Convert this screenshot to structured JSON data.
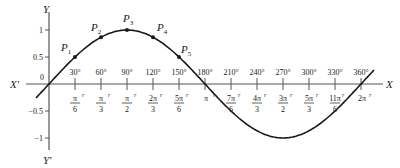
{
  "diagram": {
    "type": "sine-curve",
    "function": "y = sin x",
    "axes": {
      "x_label": "X",
      "x_neg_label": "X'",
      "y_label": "Y",
      "y_neg_label": "Y'",
      "origin_label": "0"
    },
    "y_ticks": [
      {
        "value": 1,
        "label": "1"
      },
      {
        "value": 0.5,
        "label": "0.5"
      },
      {
        "value": -0.5,
        "label": "−0.5"
      },
      {
        "value": -1,
        "label": "−1"
      }
    ],
    "x_ticks": [
      {
        "deg": 30,
        "deg_label": "30°",
        "rad_num": "π",
        "rad_den": "6"
      },
      {
        "deg": 60,
        "deg_label": "60°",
        "rad_num": "π",
        "rad_den": "3"
      },
      {
        "deg": 90,
        "deg_label": "90°",
        "rad_num": "π",
        "rad_den": "2"
      },
      {
        "deg": 120,
        "deg_label": "120°",
        "rad_num": "2π",
        "rad_den": "3"
      },
      {
        "deg": 150,
        "deg_label": "150°",
        "rad_num": "5π",
        "rad_den": "6"
      },
      {
        "deg": 180,
        "deg_label": "180°",
        "rad_num": "π",
        "rad_den": ""
      },
      {
        "deg": 210,
        "deg_label": "210°",
        "rad_num": "7π",
        "rad_den": "6"
      },
      {
        "deg": 240,
        "deg_label": "240°",
        "rad_num": "4π",
        "rad_den": "3"
      },
      {
        "deg": 270,
        "deg_label": "270°",
        "rad_num": "3π",
        "rad_den": "2"
      },
      {
        "deg": 300,
        "deg_label": "300°",
        "rad_num": "5π",
        "rad_den": "3"
      },
      {
        "deg": 330,
        "deg_label": "330°",
        "rad_num": "11π",
        "rad_den": "6"
      },
      {
        "deg": 360,
        "deg_label": "360°",
        "rad_num": "2π",
        "rad_den": ""
      }
    ],
    "radian_superscript": "r",
    "curve_domain_deg": [
      -15,
      375
    ],
    "points": [
      {
        "label": "P",
        "sub": "1",
        "deg": 30
      },
      {
        "label": "P",
        "sub": "2",
        "deg": 60
      },
      {
        "label": "P",
        "sub": "3",
        "deg": 90
      },
      {
        "label": "P",
        "sub": "4",
        "deg": 120
      },
      {
        "label": "P",
        "sub": "5",
        "deg": 150
      }
    ],
    "colors": {
      "ink": "#1a1a1a",
      "axis": "#555555"
    }
  }
}
